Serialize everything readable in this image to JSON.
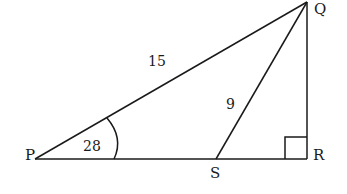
{
  "diagram": {
    "type": "right triangle with cevian",
    "vertices": {
      "P": {
        "label": "P",
        "x": 35,
        "y": 159
      },
      "Q": {
        "label": "Q",
        "x": 307,
        "y": 2
      },
      "R": {
        "label": "R",
        "x": 307,
        "y": 159
      },
      "S": {
        "label": "S",
        "x": 216,
        "y": 159
      }
    },
    "segments": [
      {
        "from": "P",
        "to": "Q",
        "label": "15"
      },
      {
        "from": "Q",
        "to": "S",
        "label": "9"
      },
      {
        "from": "Q",
        "to": "R",
        "label": ""
      },
      {
        "from": "P",
        "to": "R",
        "label": ""
      }
    ],
    "angle_P": {
      "label": "28"
    },
    "right_angle_at": "R",
    "colors": {
      "stroke": "#1a1a1a",
      "background": "#ffffff"
    }
  }
}
